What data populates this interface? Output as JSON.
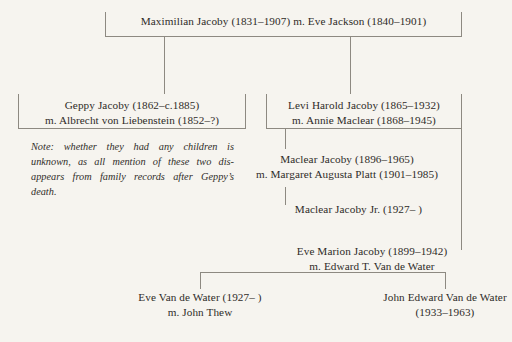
{
  "document": {
    "kind": "family-tree",
    "background_color": "#f6f4ef",
    "text_color": "#2e2b28",
    "rule_color": "#8d8981"
  },
  "generations": {
    "root": {
      "name": "Maximilian Jacoby (1831–1907) m. Eve Jackson (1840–1901)"
    },
    "children_of_root": {
      "geppy": {
        "line1": "Geppy Jacoby (1862–c.1885)",
        "line2": "m. Albrecht von Liebenstein (1852–?)"
      },
      "levi": {
        "line1": "Levi Harold Jacoby (1865–1932)",
        "line2": "m. Annie Maclear (1868–1945)"
      }
    },
    "note": {
      "line1": "Note: whether they had any children is",
      "line2": "unknown, as all mention of these two dis-",
      "line3": "appears from family records after Geppy’s",
      "line4": "death."
    },
    "children_of_levi": {
      "maclear": {
        "line1": "Maclear Jacoby (1896–1965)",
        "line2": "m. Margaret Augusta Platt (1901–1985)"
      },
      "eve_marion": {
        "line1": "Eve Marion Jacoby (1899–1942)",
        "line2": "m. Edward T. Van de Water"
      }
    },
    "child_of_maclear": {
      "maclear_jr": {
        "line1": "Maclear Jacoby Jr. (1927–    )"
      }
    },
    "children_of_eve_marion": {
      "eve_vdw": {
        "line1": "Eve Van de Water (1927–    )",
        "line2": "m. John Thew"
      },
      "john_edward_vdw": {
        "line1": "John Edward Van de Water",
        "line2": "(1933–1963)"
      }
    }
  }
}
